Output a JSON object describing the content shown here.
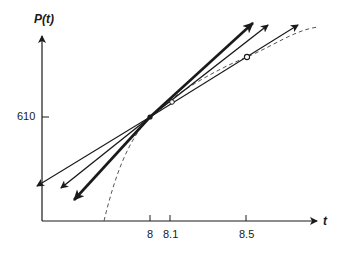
{
  "figure": {
    "y_axis_label": "P(t)",
    "x_axis_label": "t",
    "y_ticks": [
      {
        "label": "610",
        "value": 610
      }
    ],
    "x_ticks": [
      {
        "label": "8",
        "value": 8
      },
      {
        "label": "8.1",
        "value": 8.1
      },
      {
        "label": "8.5",
        "value": 8.5
      }
    ],
    "curve": {
      "style": "dashed",
      "description": "P(t)"
    },
    "point_of_tangency": {
      "t": 8,
      "P": 610,
      "marker": "filled-dot"
    },
    "secant_points": [
      {
        "t": 8.1,
        "marker": "open-circle"
      },
      {
        "t": 8.5,
        "marker": "open-circle"
      }
    ],
    "lines": [
      {
        "name": "tangent-line",
        "through": [
          8
        ],
        "weight": "bold"
      },
      {
        "name": "secant-8-8.1",
        "through": [
          8,
          8.1
        ],
        "weight": "medium"
      },
      {
        "name": "secant-8-8.5",
        "through": [
          8,
          8.5
        ],
        "weight": "thin"
      }
    ],
    "colors": {
      "ink": "#1a1a1a",
      "dashed_curve": "#555555"
    }
  }
}
